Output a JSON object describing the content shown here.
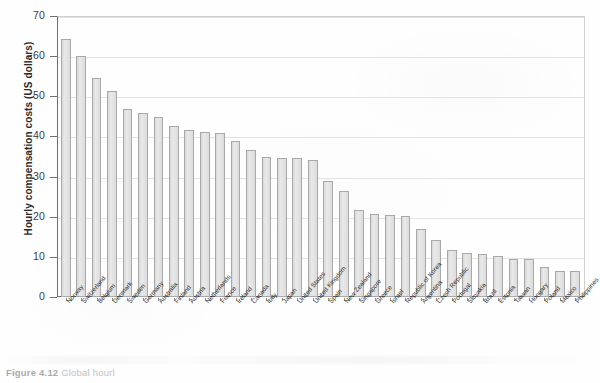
{
  "figure": {
    "caption_number": "Figure 4.12",
    "caption_text": "Global hourl"
  },
  "chart_data": {
    "type": "bar",
    "title": "",
    "xlabel": "",
    "ylabel": "Hourly compensation costs (US dollars)",
    "ylim": [
      0,
      70
    ],
    "yticks": [
      0,
      10,
      20,
      30,
      40,
      50,
      60,
      70
    ],
    "ytick_labels": [
      "0",
      "10",
      "20",
      "30",
      "40",
      "50",
      "60",
      "70"
    ],
    "grid": true,
    "legend": "none",
    "bar_color": "#e4e4e4",
    "bar_edge_color": "#a9a9a9",
    "categories": [
      "Norway",
      "Switzerland",
      "Belgium",
      "Denmark",
      "Sweden",
      "Germany",
      "Australia",
      "Finland",
      "Austria",
      "Netherlands",
      "France",
      "Ireland",
      "Canada",
      "Italy",
      "Japan",
      "United States",
      "United Kingdom",
      "Spain",
      "New Zealand",
      "Singapore",
      "Greece",
      "Israel",
      "Republic of Korea",
      "Argentina",
      "Czech Republic",
      "Portugal",
      "Slovakia",
      "Brazil",
      "Estonia",
      "Taiwan",
      "Hungary",
      "Poland",
      "Mexico",
      "Philippines"
    ],
    "values": [
      64.2,
      60.0,
      54.6,
      51.2,
      46.8,
      45.8,
      44.8,
      42.6,
      41.6,
      41.0,
      40.9,
      38.8,
      36.6,
      35.0,
      34.7,
      34.7,
      34.2,
      28.9,
      26.4,
      21.6,
      20.6,
      20.4,
      20.2,
      17.0,
      14.3,
      11.6,
      10.9,
      10.8,
      10.1,
      9.5,
      9.4,
      7.4,
      6.6,
      6.5
    ],
    "extra_values": [
      5.5,
      1.9
    ],
    "extra_categories": [
      "Mexico",
      "Philippines"
    ]
  }
}
